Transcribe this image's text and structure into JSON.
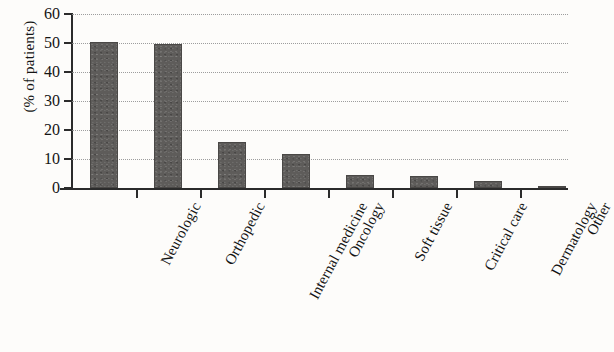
{
  "chart_data": {
    "type": "bar",
    "title": "",
    "subtitle": "",
    "xlabel": "",
    "ylabel": "(% of patients)",
    "categories": [
      "Neurologic",
      "Orthopedic",
      "Internal medicine",
      "Oncology",
      "Soft tissue",
      "Critical care",
      "Dermatology",
      "Other"
    ],
    "values": [
      50.5,
      49.5,
      16,
      11.7,
      4.5,
      4,
      2.5,
      0.5
    ],
    "ylim": [
      0,
      60
    ],
    "ytick_labels": [
      "60",
      "50",
      "40",
      "30",
      "20",
      "10",
      "0"
    ],
    "ytick_values": [
      60,
      50,
      40,
      30,
      20,
      10,
      0
    ],
    "grid": "dotted-horizontal",
    "legend": "none",
    "bar_color": "#5e5c5a",
    "axis_color": "#2b2b2b",
    "background_color": "#fdfcfa"
  }
}
